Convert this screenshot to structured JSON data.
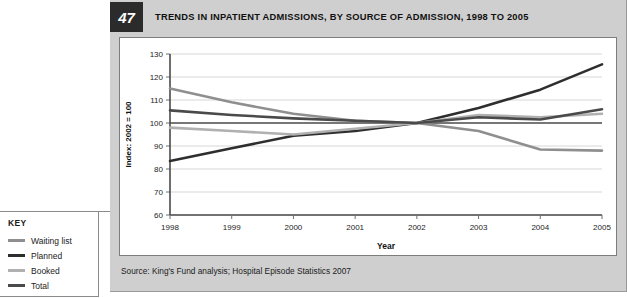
{
  "figure": {
    "number": "47",
    "title": "TRENDS IN INPATIENT ADMISSIONS, BY SOURCE OF ADMISSION, 1998 TO 2005",
    "source": "Source: King's Fund analysis; Hospital Episode Statistics 2007"
  },
  "key": {
    "title": "KEY",
    "items": [
      {
        "label": "Waiting list",
        "color": "#8f8f8f"
      },
      {
        "label": "Planned",
        "color": "#2e2e2e"
      },
      {
        "label": "Booked",
        "color": "#b0b0b0"
      },
      {
        "label": "Total",
        "color": "#4a4a4a"
      }
    ]
  },
  "chart_data": {
    "type": "line",
    "title": "TRENDS IN INPATIENT ADMISSIONS, BY SOURCE OF ADMISSION, 1998 TO 2005",
    "xlabel": "Year",
    "ylabel": "Index: 2002 = 100",
    "categories": [
      "1998",
      "1999",
      "2000",
      "2001",
      "2002",
      "2003",
      "2004",
      "2005"
    ],
    "x": [
      1998,
      1999,
      2000,
      2001,
      2002,
      2003,
      2004,
      2005
    ],
    "xlim": [
      1998,
      2005
    ],
    "ylim": [
      60,
      130
    ],
    "yticks": [
      60,
      70,
      80,
      90,
      100,
      110,
      120,
      130
    ],
    "grid": true,
    "reference_line": 100,
    "legend_position": "left-outside",
    "series": [
      {
        "name": "Waiting list",
        "color": "#8f8f8f",
        "width": 2.6,
        "values": [
          115,
          109,
          104,
          101,
          100,
          96.5,
          88.5,
          88
        ]
      },
      {
        "name": "Planned",
        "color": "#2e2e2e",
        "width": 2.6,
        "values": [
          83.5,
          89,
          94.5,
          96.5,
          100,
          106.5,
          114.5,
          125.5
        ]
      },
      {
        "name": "Booked",
        "color": "#b0b0b0",
        "width": 2.6,
        "values": [
          98,
          96.5,
          95,
          97.5,
          100,
          103.5,
          102.5,
          104
        ]
      },
      {
        "name": "Total",
        "color": "#4a4a4a",
        "width": 2.6,
        "values": [
          105.5,
          103.5,
          102,
          101,
          100,
          102.5,
          101.5,
          106
        ]
      }
    ]
  }
}
